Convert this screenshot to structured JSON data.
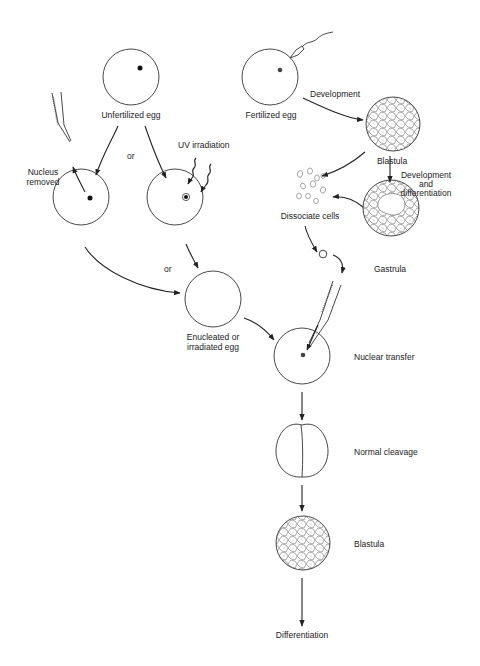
{
  "labels": {
    "unfertilized_egg": "Unfertilized egg",
    "fertilized_egg": "Fertilized egg",
    "development": "Development",
    "blastula_top": "Blastula",
    "or_top": "or",
    "uv_irradiation": "UV irradiation",
    "nucleus_removed_1": "Nucleus",
    "nucleus_removed_2": "removed",
    "development_and_differentiation_1": "Development",
    "development_and_differentiation_2": "and",
    "development_and_differentiation_3": "differentiation",
    "dissociate_cells": "Dissociate cells",
    "gastrula": "Gastrula",
    "or_middle": "or",
    "enucleated_1": "Enucleated or",
    "enucleated_2": "irradiated egg",
    "nuclear_transfer": "Nuclear transfer",
    "normal_cleavage": "Normal cleavage",
    "blastula_bottom": "Blastula",
    "differentiation": "Differentiation"
  },
  "colors": {
    "line": "#333333",
    "nucleus": "#111111",
    "background": "#ffffff"
  }
}
